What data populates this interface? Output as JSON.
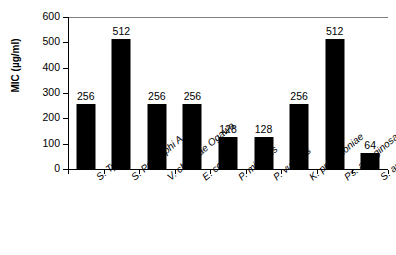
{
  "chart_data": {
    "type": "bar",
    "title": "",
    "xlabel": "",
    "ylabel": "MIC (µg/ml)",
    "ylim": [
      0,
      600
    ],
    "yticks": [
      0,
      100,
      200,
      300,
      400,
      500,
      600
    ],
    "ytick_labels": [
      "0",
      "100",
      "200",
      "300",
      "400",
      "500",
      "600"
    ],
    "grid": false,
    "legend": null,
    "bar_color": "#000000",
    "categories": [
      "S. Typhi",
      "S. Paratyphi A",
      "V. cholerae Ogawa",
      "E. coli",
      "P. mirabilis",
      "P. vulgaris",
      "K. pneumoniae",
      "Ps. aeruginosa",
      "S. aureus"
    ],
    "values": [
      256,
      512,
      256,
      256,
      128,
      128,
      256,
      512,
      64
    ],
    "data_labels": [
      "256",
      "512",
      "256",
      "256",
      "128",
      "128",
      "256",
      "512",
      "64"
    ]
  },
  "axes": {
    "y_title": "MIC (µg/ml)"
  }
}
